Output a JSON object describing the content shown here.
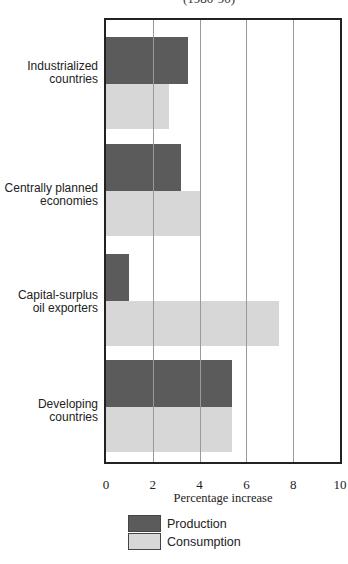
{
  "chart_data": {
    "type": "bar",
    "orientation": "horizontal",
    "title": "(1980-90)",
    "categories": [
      "Industrialized countries",
      "Centrally planned economies",
      "Capital-surplus oil exporters",
      "Developing countries"
    ],
    "category_label_lines": [
      [
        "Industrialized",
        "countries"
      ],
      [
        "Centrally planned",
        "economies"
      ],
      [
        "Capital-surplus",
        "oil exporters"
      ],
      [
        "Developing",
        "countries"
      ]
    ],
    "series": [
      {
        "name": "Production",
        "color": "#5b5b5b",
        "values": [
          3.5,
          3.2,
          1.0,
          5.4
        ]
      },
      {
        "name": "Consumption",
        "color": "#d7d7d7",
        "values": [
          2.7,
          4.0,
          7.4,
          5.4
        ]
      }
    ],
    "xlabel": "Percentage increase",
    "ylabel": "",
    "xlim": [
      0,
      10
    ],
    "xticks": [
      "0",
      "2",
      "4",
      "6",
      "8",
      "10"
    ],
    "grid": "vertical",
    "legend_position": "bottom"
  },
  "legend": {
    "items": [
      {
        "label": "Production"
      },
      {
        "label": "Consumption"
      }
    ]
  }
}
